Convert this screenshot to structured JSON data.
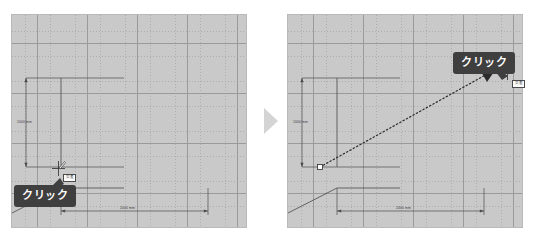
{
  "document": {
    "title": "CAD drawing tutorial — two-step click illustration",
    "background_color": "#ffffff"
  },
  "colors": {
    "panel_background": "#c9c9c9",
    "panel_border": "#b9b9b9",
    "grid_major": "#9a9a9a",
    "grid_minor": "#adadad",
    "geometry": "#4a4a4a",
    "callout_background": "#3f3f3f",
    "callout_text": "#ffffff",
    "step_arrow": "#d4d4d4",
    "snap_tip_background": "#fdfdfd",
    "snap_tip_border": "#4a4a4a"
  },
  "step_arrow": {
    "icon": "triangle-right-icon",
    "direction": "right"
  },
  "panels": [
    {
      "id": "step-1",
      "position": "left",
      "callout": {
        "label": "クリック",
        "anchor": "cursor"
      },
      "snap_tip": {
        "label": "交差"
      },
      "cursor": {
        "icon": "crosshair-pen-cursor-icon",
        "x": 56,
        "y": 168
      },
      "dimensions": [
        {
          "orientation": "vertical",
          "label": "1000 mm"
        },
        {
          "orientation": "horizontal",
          "label": "2000 mm"
        }
      ],
      "drag_line": null
    },
    {
      "id": "step-2",
      "position": "right",
      "callout": {
        "label": "クリック",
        "anchor": "cursor"
      },
      "snap_tip": {
        "label": "交差"
      },
      "cursor": {
        "icon": "crosshair-pen-cursor-icon",
        "x": 505,
        "y": 72
      },
      "dimensions": [
        {
          "orientation": "vertical",
          "label": "1000 mm"
        },
        {
          "orientation": "horizontal",
          "label": "2000 mm"
        }
      ],
      "drag_line": {
        "style": "dotted",
        "start_marker": "square",
        "end_marker": "arrowhead",
        "from": {
          "x": 32,
          "y": 152
        },
        "to": {
          "x": 206,
          "y": 54
        }
      }
    }
  ]
}
